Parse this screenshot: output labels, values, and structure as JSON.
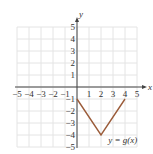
{
  "chart_data": {
    "type": "line",
    "title": "",
    "xlabel": "x",
    "ylabel": "y",
    "xlim": [
      -5,
      5
    ],
    "ylim": [
      -5,
      5
    ],
    "grid": true,
    "x_ticks": [
      "-5",
      "-4",
      "-3",
      "-2",
      "-1",
      "1",
      "2",
      "3",
      "4",
      "5"
    ],
    "y_ticks": [
      "5",
      "4",
      "3",
      "2",
      "1",
      "-1",
      "-2",
      "-3",
      "-4",
      "-5"
    ],
    "series": [
      {
        "name": "y = g(x)",
        "x": [
          0,
          2,
          4
        ],
        "y": [
          -1,
          -4,
          -1
        ]
      }
    ],
    "annotations": [
      {
        "text": "y = g(x)",
        "x": 2.6,
        "y": -4.4
      }
    ],
    "colors": {
      "line": "#9b5c3a",
      "grid": "#e4e4e4",
      "axis": "#444444"
    }
  }
}
